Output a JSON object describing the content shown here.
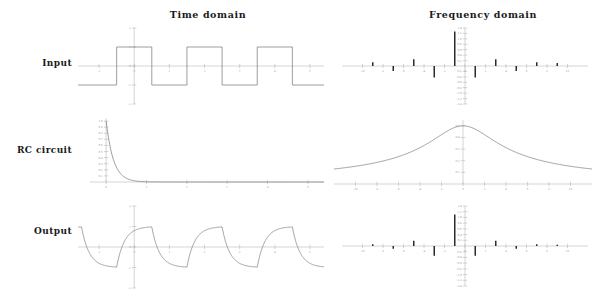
{
  "figure": {
    "background": "#ffffff",
    "curve_color": "#7d7d7d",
    "stem_color": "#2b2b2b",
    "axis_color": "#b9b9b9",
    "text_color": "#1a1a1a"
  },
  "columns": {
    "time_title": "Time domain",
    "frequency_title": "Frequency domain"
  },
  "rows": {
    "input_label": "Input",
    "rc_label": "RC circuit",
    "output_label": "Output"
  },
  "chart_data": [
    {
      "id": "input-time",
      "type": "line",
      "title": "Input",
      "xlabel": "",
      "ylabel": "",
      "xlim": [
        -1.6,
        5.4
      ],
      "ylim": [
        -2,
        2
      ],
      "xticks": [
        -1,
        0,
        1,
        2,
        3,
        4,
        5
      ],
      "xticklabels": [
        "-1",
        "0",
        "1",
        "2",
        "3",
        "4",
        "5"
      ],
      "yticks": [
        -2,
        -1,
        0,
        1,
        2
      ],
      "yticklabels": [
        "-2",
        "-1",
        "0",
        "1",
        "2"
      ],
      "grid": false,
      "legend": "none",
      "description": "Square wave, period 2, amplitude +/-1",
      "waveform": "square",
      "period": 2,
      "amplitude": 1,
      "x": [
        -1.6,
        -0.5,
        -0.5,
        0.5,
        0.5,
        1.5,
        1.5,
        2.5,
        2.5,
        3.5,
        3.5,
        4.5,
        4.5,
        5.4
      ],
      "y": [
        -1,
        -1,
        1,
        1,
        -1,
        -1,
        1,
        1,
        -1,
        -1,
        1,
        1,
        -1,
        -1
      ]
    },
    {
      "id": "input-frequency",
      "type": "bar",
      "title": "Input spectrum",
      "xlabel": "",
      "ylabel": "",
      "xlim": [
        -12,
        12
      ],
      "ylim": [
        -1.4,
        1.4
      ],
      "xticks": [
        -10,
        -8,
        -6,
        -4,
        -2,
        0,
        2,
        4,
        6,
        8,
        10
      ],
      "xticklabels": [
        "-10",
        "-8",
        "-6",
        "-4",
        "-2",
        "0",
        "2",
        "4",
        "6",
        "8",
        "10"
      ],
      "yticks": [
        -1.4,
        -1.2,
        -1.0,
        -0.8,
        -0.6,
        -0.4,
        -0.2,
        0.2,
        0.4,
        0.6,
        0.8,
        1.0,
        1.2,
        1.4
      ],
      "yticklabels": [
        "-1.4",
        "-1.2",
        "-1.0",
        "-0.8",
        "-0.6",
        "-0.4",
        "-0.2",
        "0.2",
        "0.4",
        "0.6",
        "0.8",
        "1.0",
        "1.2",
        "1.4"
      ],
      "grid": false,
      "legend": "none",
      "description": "Fourier coefficients of square wave, odd harmonics with alternating sign, 1/n decay",
      "x": [
        -9,
        -7,
        -5,
        -3,
        -1,
        1,
        3,
        5,
        7,
        9
      ],
      "values": [
        0.14,
        -0.18,
        0.25,
        -0.42,
        1.27,
        -0.42,
        0.25,
        -0.18,
        0.14,
        0.11
      ]
    },
    {
      "id": "rc-time",
      "type": "line",
      "title": "RC impulse response",
      "xlabel": "",
      "ylabel": "",
      "xlim": [
        -0.4,
        5.4
      ],
      "ylim": [
        0,
        1.05
      ],
      "xticks": [
        0,
        1,
        2,
        3,
        4,
        5
      ],
      "xticklabels": [
        "0",
        "1",
        "2",
        "3",
        "4",
        "5"
      ],
      "yticks": [
        0.1,
        0.2,
        0.3,
        0.4,
        0.5,
        0.6,
        0.7,
        0.8,
        0.9,
        1.0
      ],
      "yticklabels": [
        "0.1",
        "0.2",
        "0.3",
        "0.4",
        "0.5",
        "0.6",
        "0.7",
        "0.8",
        "0.9",
        "1.0"
      ],
      "grid": false,
      "legend": "none",
      "description": "Decaying exponential exp(-t/tau) starting at 1.0 at t=0",
      "function": "exp(-t/0.18)",
      "tau": 0.18
    },
    {
      "id": "rc-frequency",
      "type": "line",
      "title": "RC transfer magnitude",
      "xlabel": "",
      "ylabel": "",
      "xlim": [
        -12,
        12
      ],
      "ylim": [
        0,
        0.55
      ],
      "xticks": [
        -10,
        -8,
        -6,
        -4,
        -2,
        0,
        2,
        4,
        6,
        8,
        10
      ],
      "xticklabels": [
        "-10",
        "-8",
        "-6",
        "-4",
        "-2",
        "0",
        "2",
        "4",
        "6",
        "8",
        "10"
      ],
      "yticks": [
        0.1,
        0.2,
        0.3,
        0.4,
        0.5
      ],
      "yticklabels": [
        "0.1",
        "0.2",
        "0.3",
        "0.4",
        "0.5"
      ],
      "grid": false,
      "legend": "none",
      "description": "Lorentzian lowpass magnitude peaked at 0 with value 0.5",
      "function": "0.5/sqrt(1+(f/3.2)^2)",
      "peak": 0.5,
      "half_width": 3.2
    },
    {
      "id": "output-time",
      "type": "line",
      "title": "Filtered output",
      "xlabel": "",
      "ylabel": "",
      "xlim": [
        -1.6,
        5.4
      ],
      "ylim": [
        -2,
        2
      ],
      "xticks": [
        -1,
        0,
        1,
        2,
        3,
        4,
        5
      ],
      "xticklabels": [
        "-1",
        "0",
        "1",
        "2",
        "3",
        "4",
        "5"
      ],
      "yticks": [
        -2,
        -1,
        0,
        1,
        2
      ],
      "yticklabels": [
        "-2",
        "-1",
        "0",
        "1",
        "2"
      ],
      "grid": false,
      "legend": "none",
      "description": "Square wave after RC lowpass: exponential charge and discharge between +1 and -1",
      "waveform": "rc-filtered-square",
      "period": 2,
      "amplitude": 1,
      "tau": 0.22
    },
    {
      "id": "output-frequency",
      "type": "bar",
      "title": "Output spectrum",
      "xlabel": "",
      "ylabel": "",
      "xlim": [
        -12,
        12
      ],
      "ylim": [
        -1.4,
        1.4
      ],
      "xticks": [
        -10,
        -8,
        -6,
        -4,
        -2,
        0,
        2,
        4,
        6,
        8,
        10
      ],
      "xticklabels": [
        "-10",
        "-8",
        "-6",
        "-4",
        "-2",
        "0",
        "2",
        "4",
        "6",
        "8",
        "10"
      ],
      "yticks": [
        -1.4,
        -1.2,
        -1.0,
        -0.8,
        -0.6,
        -0.4,
        -0.2,
        0.2,
        0.4,
        0.6,
        0.8,
        1.0,
        1.2,
        1.4
      ],
      "yticklabels": [
        "-1.4",
        "-1.2",
        "-1.0",
        "-0.8",
        "-0.6",
        "-0.4",
        "-0.2",
        "0.2",
        "0.4",
        "0.6",
        "0.8",
        "1.0",
        "1.2",
        "1.4"
      ],
      "grid": false,
      "legend": "none",
      "description": "Input spectrum multiplied by RC lowpass response, higher harmonics attenuated",
      "x": [
        -9,
        -7,
        -5,
        -3,
        -1,
        1,
        3,
        5,
        7,
        9
      ],
      "values": [
        0.06,
        -0.1,
        0.18,
        -0.34,
        1.1,
        -0.34,
        0.18,
        -0.1,
        0.06,
        0.04
      ]
    }
  ]
}
